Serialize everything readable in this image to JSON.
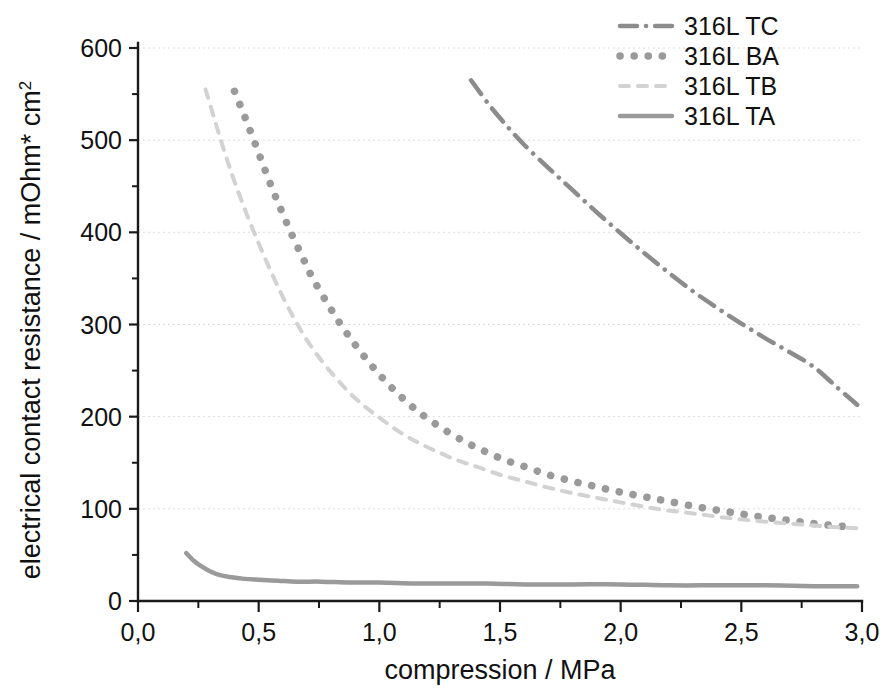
{
  "chart_data": {
    "type": "line",
    "title": "",
    "xlabel": "compression / MPa",
    "ylabel": "electrical contact resistance / mOhm* cm2",
    "ylabel_main": "electrical contact resistance / mOhm* cm",
    "ylabel_exponent": "2",
    "xlim": [
      0.0,
      3.0
    ],
    "ylim": [
      0,
      600
    ],
    "xticks": [
      0.0,
      0.5,
      1.0,
      1.5,
      2.0,
      2.5,
      3.0
    ],
    "xticklabels": [
      "0,0",
      "0,5",
      "1,0",
      "1,5",
      "2,0",
      "2,5",
      "3,0"
    ],
    "yticks": [
      0,
      100,
      200,
      300,
      400,
      500,
      600
    ],
    "yticklabels": [
      "0",
      "100",
      "200",
      "300",
      "400",
      "500",
      "600"
    ],
    "xminorticks": [
      0.25,
      0.75,
      1.25,
      1.75,
      2.25,
      2.75
    ],
    "yminorticks": [
      50,
      150,
      250,
      350,
      450,
      550
    ],
    "grid": "horizontal-major-dotted",
    "legend_position": "top-right",
    "series": [
      {
        "name": "316L TC",
        "style": "dash-dot",
        "color": "#8c8c8c",
        "width": 4.5,
        "x": [
          1.38,
          1.45,
          1.5,
          1.55,
          1.6,
          1.7,
          1.8,
          1.9,
          2.0,
          2.1,
          2.2,
          2.3,
          2.4,
          2.5,
          2.6,
          2.7,
          2.8,
          2.9,
          2.98
        ],
        "y": [
          565,
          540,
          524,
          509,
          495,
          470,
          446,
          422,
          399,
          377,
          356,
          336,
          318,
          301,
          285,
          270,
          254,
          231,
          213
        ]
      },
      {
        "name": "316L BA",
        "style": "dotted",
        "color": "#9a9a9a",
        "width": 7.5,
        "x": [
          0.4,
          0.44,
          0.48,
          0.52,
          0.56,
          0.6,
          0.64,
          0.68,
          0.72,
          0.78,
          0.84,
          0.9,
          0.96,
          1.02,
          1.08,
          1.14,
          1.2,
          1.28,
          1.36,
          1.44,
          1.52,
          1.6,
          1.7,
          1.8,
          1.9,
          2.0,
          2.1,
          2.2,
          2.32,
          2.44,
          2.56,
          2.68,
          2.8,
          2.92
        ],
        "y": [
          553,
          527,
          500,
          472,
          445,
          420,
          396,
          374,
          352,
          325,
          300,
          278,
          258,
          240,
          224,
          210,
          198,
          184,
          172,
          162,
          153,
          146,
          137,
          130,
          124,
          118,
          113,
          108,
          102,
          97,
          92,
          88,
          84,
          81
        ]
      },
      {
        "name": "316L TB",
        "style": "dashed",
        "color": "#d2d2d2",
        "width": 4.0,
        "x": [
          0.28,
          0.32,
          0.36,
          0.4,
          0.45,
          0.5,
          0.55,
          0.6,
          0.65,
          0.7,
          0.76,
          0.82,
          0.88,
          0.94,
          1.0,
          1.08,
          1.16,
          1.24,
          1.32,
          1.4,
          1.5,
          1.6,
          1.7,
          1.8,
          1.9,
          2.0,
          2.15,
          2.3,
          2.45,
          2.6,
          2.75,
          2.9,
          2.98
        ],
        "y": [
          555,
          520,
          486,
          455,
          420,
          388,
          358,
          330,
          305,
          283,
          261,
          242,
          225,
          211,
          199,
          184,
          172,
          162,
          153,
          146,
          137,
          130,
          123,
          117,
          112,
          107,
          100,
          95,
          90,
          86,
          83,
          80,
          79
        ]
      },
      {
        "name": "316L TA",
        "style": "solid",
        "color": "#9a9a9a",
        "width": 4.5,
        "x": [
          0.2,
          0.23,
          0.26,
          0.3,
          0.34,
          0.38,
          0.44,
          0.5,
          0.58,
          0.66,
          0.76,
          0.88,
          1.0,
          1.15,
          1.3,
          1.45,
          1.6,
          1.8,
          2.0,
          2.2,
          2.4,
          2.6,
          2.8,
          2.98
        ],
        "y": [
          52,
          44,
          38,
          32,
          28,
          26,
          24,
          23,
          22,
          21,
          21,
          20,
          20,
          19,
          19,
          19,
          18,
          18,
          18,
          17,
          17,
          17,
          16,
          16
        ]
      }
    ]
  },
  "legend": {
    "items": [
      {
        "label": "316L TC"
      },
      {
        "label": "316L BA"
      },
      {
        "label": "316L TB"
      },
      {
        "label": "316L TA"
      }
    ]
  }
}
